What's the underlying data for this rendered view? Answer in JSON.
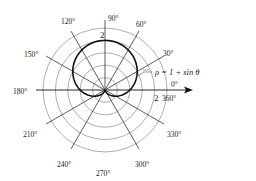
{
  "chart_data": {
    "type": "polar-line",
    "title": "",
    "equation_label": "ρ = 1 + sin θ",
    "function": "1+sin",
    "center": {
      "x": 105,
      "y": 90
    },
    "unit_px": 24.8,
    "rings": [
      0.5,
      1.0,
      1.5,
      2.0,
      2.5
    ],
    "radial_label": {
      "value": "2",
      "positions": [
        "top",
        "right"
      ]
    },
    "rays_deg": [
      30,
      60,
      90,
      120,
      150,
      210,
      240,
      300,
      330
    ],
    "angle_labels": [
      {
        "deg": 0,
        "text": "0°"
      },
      {
        "deg": 30,
        "text": "30°"
      },
      {
        "deg": 60,
        "text": "60°"
      },
      {
        "deg": 90,
        "text": "90°"
      },
      {
        "deg": 120,
        "text": "120°"
      },
      {
        "deg": 150,
        "text": "150°"
      },
      {
        "deg": 180,
        "text": "180°"
      },
      {
        "deg": 210,
        "text": "210°"
      },
      {
        "deg": 240,
        "text": "240°"
      },
      {
        "deg": 270,
        "text": "270°"
      },
      {
        "deg": 300,
        "text": "300°"
      },
      {
        "deg": 330,
        "text": "330°"
      },
      {
        "deg": 360,
        "text": "360°"
      }
    ],
    "series": [
      {
        "name": "ρ = 1 + sin θ",
        "theta_range_deg": [
          0,
          360
        ],
        "samples": [
          {
            "theta": 0,
            "rho": 1.0
          },
          {
            "theta": 30,
            "rho": 1.5
          },
          {
            "theta": 60,
            "rho": 1.866
          },
          {
            "theta": 90,
            "rho": 2.0
          },
          {
            "theta": 120,
            "rho": 1.866
          },
          {
            "theta": 150,
            "rho": 1.5
          },
          {
            "theta": 180,
            "rho": 1.0
          },
          {
            "theta": 210,
            "rho": 0.5
          },
          {
            "theta": 240,
            "rho": 0.134
          },
          {
            "theta": 270,
            "rho": 0.0
          },
          {
            "theta": 300,
            "rho": 0.134
          },
          {
            "theta": 330,
            "rho": 0.5
          },
          {
            "theta": 360,
            "rho": 1.0
          }
        ]
      }
    ]
  },
  "labels": {
    "radial_top": "2",
    "radial_right": "2",
    "equation": "ρ = 1 + sin θ",
    "deg0": "0°",
    "deg30": "30°",
    "deg60": "60°",
    "deg90": "90°",
    "deg120": "120°",
    "deg150": "150°",
    "deg180": "180°",
    "deg210": "210°",
    "deg240": "240°",
    "deg270": "270°",
    "deg300": "300°",
    "deg330": "330°",
    "deg360": "360°"
  }
}
